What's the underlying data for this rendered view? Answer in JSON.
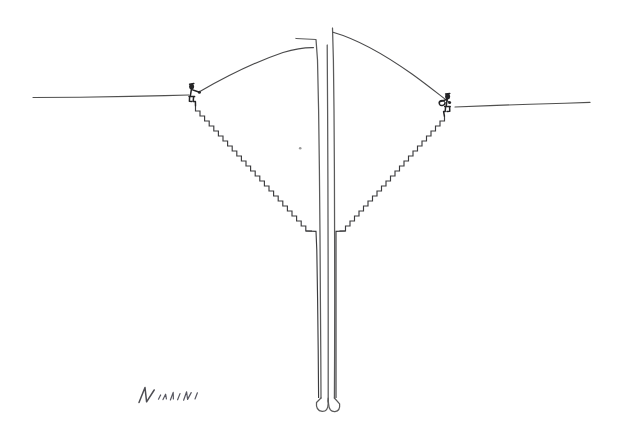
{
  "artwork": {
    "title": "Untitled pen-and-ink line drawing",
    "medium": "ink on paper",
    "background_color": "#ffffff",
    "ink_color": "#3a3a3c",
    "width": 617,
    "height": 443,
    "signature": {
      "text": "Natali",
      "position": "bottom-left",
      "x": 138,
      "y": 398
    },
    "scene_description": "A horizon line interrupted by a deep V-shaped excavation. Two mirrored staircases descend from the rim toward a tall narrow central column. Two small seated figures perch at the rim of the pit, joined by a long arc that passes over the top of the column.",
    "elements": [
      {
        "name": "horizon-left",
        "label": "Left horizon line",
        "from_x": 33,
        "from_y": 97,
        "to_x": 190,
        "to_y": 95
      },
      {
        "name": "horizon-right",
        "label": "Right horizon line",
        "from_x": 455,
        "from_y": 107,
        "to_x": 590,
        "to_y": 102
      },
      {
        "name": "arc-left",
        "label": "Left arc span",
        "from_x": 199,
        "from_y": 92,
        "to_x": 311,
        "to_y": 48
      },
      {
        "name": "arc-right",
        "label": "Right arc span",
        "from_x": 334,
        "from_y": 33,
        "to_x": 449,
        "to_y": 102
      },
      {
        "name": "staircase-left",
        "label": "Left descending staircase",
        "steps": 24,
        "from_x": 196,
        "from_y": 108,
        "to_x": 305,
        "to_y": 229
      },
      {
        "name": "staircase-right",
        "label": "Right descending staircase",
        "steps": 24,
        "from_x": 443,
        "from_y": 118,
        "to_x": 341,
        "to_y": 229
      },
      {
        "name": "central-column",
        "label": "Central vertical column",
        "top_y": 28,
        "bottom_y": 412,
        "left_x": 317,
        "right_x": 334
      },
      {
        "name": "figure-left",
        "label": "Seated figure at left rim",
        "x": 190,
        "y": 86
      },
      {
        "name": "figure-right",
        "label": "Seated figure at right rim",
        "x": 443,
        "y": 96
      },
      {
        "name": "ink-speck",
        "label": "Stray ink speck",
        "x": 300,
        "y": 148
      }
    ]
  }
}
